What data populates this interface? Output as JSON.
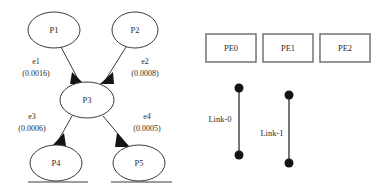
{
  "figure": {
    "title": "",
    "task_graph": {
      "nodes": [
        {
          "id": "P1",
          "label": "P1",
          "cx": 54,
          "cy": 30,
          "rx": 26,
          "ry": 18
        },
        {
          "id": "P2",
          "label": "P2",
          "cx": 135,
          "cy": 30,
          "rx": 23,
          "ry": 18
        },
        {
          "id": "P3",
          "label": "P3",
          "cx": 87,
          "cy": 100,
          "rx": 27,
          "ry": 18
        },
        {
          "id": "P4",
          "label": "P4",
          "cx": 56,
          "cy": 163,
          "rx": 26,
          "ry": 18
        },
        {
          "id": "P5",
          "label": "P5",
          "cx": 139,
          "cy": 163,
          "rx": 26,
          "ry": 18
        }
      ],
      "edges": [
        {
          "id": "e1",
          "name": "e1",
          "weight": "(0.0016)",
          "from": "P1",
          "to": "P3",
          "label_x": 36,
          "label_name_y": 64,
          "label_weight_y": 76
        },
        {
          "id": "e2",
          "name": "e2",
          "weight": "(0.0008)",
          "from": "P2",
          "to": "P3",
          "label_x": 145,
          "label_name_y": 64,
          "label_weight_y": 76
        },
        {
          "id": "e3",
          "name": "e3",
          "weight": "(0.0006)",
          "from": "P3",
          "to": "P4",
          "label_x": 32,
          "label_name_y": 119,
          "label_weight_y": 131
        },
        {
          "id": "e4",
          "name": "e4",
          "weight": "(0.0005)",
          "from": "P3",
          "to": "P5",
          "label_x": 147,
          "label_name_y": 119,
          "label_weight_y": 131
        }
      ]
    },
    "architecture_graph": {
      "processing_elements": [
        {
          "id": "PE0",
          "label": "PE0",
          "x": 206,
          "y": 34,
          "w": 50,
          "h": 28
        },
        {
          "id": "PE1",
          "label": "PE1",
          "x": 263,
          "y": 34,
          "w": 50,
          "h": 28
        },
        {
          "id": "PE2",
          "label": "PE2",
          "x": 320,
          "y": 34,
          "w": 50,
          "h": 28
        }
      ],
      "links": [
        {
          "id": "Link-0",
          "label": "Link-0",
          "line_x": 239,
          "y_top": 88,
          "y_bottom": 155,
          "label_x": 220,
          "label_y": 119
        },
        {
          "id": "Link-1",
          "label": "Link-1",
          "line_x": 289,
          "y_top": 95,
          "y_bottom": 163,
          "label_x": 272,
          "label_y": 133
        }
      ]
    },
    "colors": {
      "background": "#ffffff",
      "node_stroke": "#3a3a3a",
      "box_stroke": "#6a6a6a",
      "link": "#141414",
      "text": "#2b2b2b"
    }
  }
}
